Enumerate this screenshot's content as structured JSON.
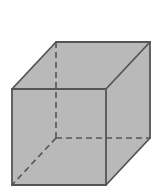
{
  "diagram": {
    "type": "cube-wireframe",
    "colors": {
      "background": "#ffffff",
      "fill": "#b9b9b9",
      "edge": "#555555"
    },
    "vertices": {
      "front_top_left": [
        12,
        89
      ],
      "front_top_right": [
        106,
        89
      ],
      "front_bottom_left": [
        12,
        185
      ],
      "front_bottom_right": [
        106,
        185
      ],
      "back_top_left": [
        56,
        42
      ],
      "back_top_right": [
        150,
        42
      ],
      "back_bottom_left": [
        56,
        138
      ],
      "back_bottom_right": [
        150,
        138
      ]
    },
    "visible_edges": [
      [
        "front_top_left",
        "front_top_right"
      ],
      [
        "front_top_right",
        "front_bottom_right"
      ],
      [
        "front_bottom_right",
        "front_bottom_left"
      ],
      [
        "front_bottom_left",
        "front_top_left"
      ],
      [
        "front_top_left",
        "back_top_left"
      ],
      [
        "back_top_left",
        "back_top_right"
      ],
      [
        "back_top_right",
        "front_top_right"
      ],
      [
        "back_top_right",
        "back_bottom_right"
      ],
      [
        "back_bottom_right",
        "front_bottom_right"
      ]
    ],
    "hidden_edges": [
      [
        "back_top_left",
        "back_bottom_left"
      ],
      [
        "back_bottom_left",
        "back_bottom_right"
      ],
      [
        "back_bottom_left",
        "front_bottom_left"
      ]
    ]
  }
}
